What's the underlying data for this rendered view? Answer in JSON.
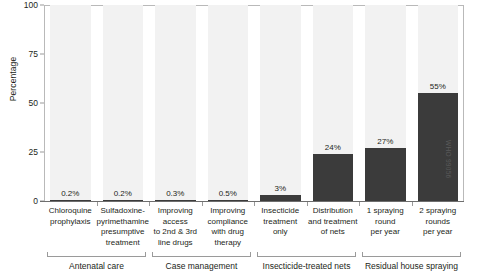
{
  "chart_data": {
    "type": "bar",
    "title": "",
    "xlabel": "",
    "ylabel": "Percentage",
    "ylim": [
      0,
      100
    ],
    "yticks": [
      0,
      25,
      50,
      75,
      100
    ],
    "ytick_labels": [
      "0",
      "25",
      "50",
      "75",
      "100"
    ],
    "grid": false,
    "legend": "none",
    "categories": [
      "Chloroquine prophylaxis",
      "Sulfadoxine-pyrimethamine presumptive treatment",
      "Improving access to 2nd & 3rd line drugs",
      "Improving compliance with drug therapy",
      "Insecticide treatment only",
      "Distribution and treatment of nets",
      "1 spraying round per year",
      "2 spraying rounds per year"
    ],
    "category_lines": [
      [
        "Chloroquine",
        "prophylaxis"
      ],
      [
        "Sulfadoxine-",
        "pyrimethamine",
        "presumptive",
        "treatment"
      ],
      [
        "Improving",
        "access",
        "to 2nd & 3rd",
        "line drugs"
      ],
      [
        "Improving",
        "compliance",
        "with drug",
        "therapy"
      ],
      [
        "Insecticide",
        "treatment",
        "only"
      ],
      [
        "Distribution",
        "and treatment",
        "of nets"
      ],
      [
        "1 spraying",
        "round",
        "per year"
      ],
      [
        "2 spraying",
        "rounds",
        "per year"
      ]
    ],
    "values": [
      0.2,
      0.2,
      0.3,
      0.5,
      3,
      24,
      27,
      55
    ],
    "value_labels": [
      "0.2%",
      "0.2%",
      "0.3%",
      "0.5%",
      "3%",
      "24%",
      "27%",
      "55%"
    ],
    "groups": [
      {
        "label": "Antenatal care",
        "start": 0,
        "end": 1
      },
      {
        "label": "Case management",
        "start": 2,
        "end": 3
      },
      {
        "label": "Insecticide-treated nets",
        "start": 4,
        "end": 5
      },
      {
        "label": "Residual house spraying",
        "start": 6,
        "end": 7
      }
    ]
  },
  "credit": "WHO 99056",
  "colors": {
    "bar": "#3b3b3b",
    "band": "#f2f2f2",
    "axis": "#6e6e6e",
    "text": "#231f20"
  }
}
